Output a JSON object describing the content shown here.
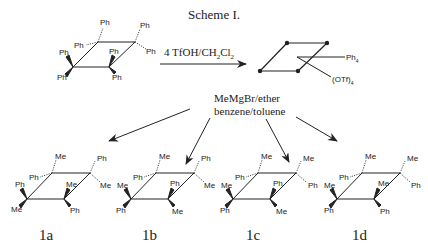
{
  "title": "Scheme I.",
  "step1": {
    "reagent": "4 TfOH/CH2Cl2",
    "reagent_parts": [
      "4 TfOH/CH",
      "2",
      "Cl",
      "2"
    ]
  },
  "intermediate": {
    "labels": [
      "Ph4",
      "(OTf)4"
    ],
    "ph": "Ph",
    "ph_sub": "4",
    "otf": "(OTf)",
    "otf_sub": "4"
  },
  "step2": {
    "reagent_line1": "MeMgBr/ether",
    "reagent_line2": "benzene/toluene"
  },
  "starting_material": {
    "substituents": [
      "Ph",
      "Ph",
      "Ph",
      "Ph",
      "Ph",
      "Ph",
      "Ph",
      "Ph"
    ]
  },
  "products": [
    {
      "label": "1a",
      "substituents": {
        "c1_up": "Me",
        "c1_left": "Ph",
        "c2_up": "Ph",
        "c2_right": "Me",
        "c3_up": "Ph",
        "c3_down": "Me",
        "c4_up": "Me",
        "c4_down": "Ph"
      }
    },
    {
      "label": "1b",
      "substituents": {
        "c1_up": "Me",
        "c1_left": "Ph",
        "c2_up": "Ph",
        "c2_right": "Me",
        "c3_up": "Me",
        "c3_down": "Ph",
        "c4_up": "Ph",
        "c4_down": "Me"
      }
    },
    {
      "label": "1c",
      "substituents": {
        "c1_up": "Me",
        "c1_left": "Ph",
        "c2_up": "Me",
        "c2_right": "Ph",
        "c3_up": "Me",
        "c3_down": "Ph",
        "c4_up": "Ph",
        "c4_down": "Me"
      }
    },
    {
      "label": "1d",
      "substituents": {
        "c1_up": "Me",
        "c1_left": "Ph",
        "c2_up": "Me",
        "c2_right": "Ph",
        "c3_up": "Me",
        "c3_down": "Ph",
        "c4_up": "Me",
        "c4_down": "Ph"
      }
    }
  ]
}
